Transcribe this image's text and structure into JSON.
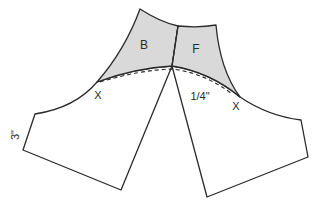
{
  "diagram": {
    "labels": {
      "back": "B",
      "front": "F",
      "notch_left": "X",
      "notch_right": "X",
      "seam_allowance": "1/4\"",
      "length": "3\""
    },
    "colors": {
      "shade": "#d9d9d9",
      "line": "#2a2a2a"
    }
  }
}
